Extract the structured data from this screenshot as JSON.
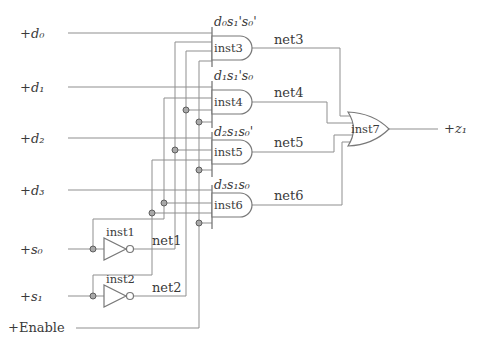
{
  "colors": {
    "background": "#ffffff",
    "wire": "#8f8f8f",
    "gate_outline": "#787878",
    "text": "#3a3a3a",
    "junction_dot": "#a8a8a8"
  },
  "inputs": [
    {
      "id": "d0",
      "label": "+d₀"
    },
    {
      "id": "d1",
      "label": "+d₁"
    },
    {
      "id": "d2",
      "label": "+d₂"
    },
    {
      "id": "d3",
      "label": "+d₃"
    },
    {
      "id": "s0",
      "label": "+s₀"
    },
    {
      "id": "s1",
      "label": "+s₁"
    },
    {
      "id": "enable",
      "label": "+Enable"
    }
  ],
  "output": {
    "label": "+z₁"
  },
  "inverters": [
    {
      "name": "inst1",
      "input": "+s₀",
      "net": "net1"
    },
    {
      "name": "inst2",
      "input": "+s₁",
      "net": "net2"
    }
  ],
  "and_gates": [
    {
      "name": "inst3",
      "expr": "d₀s₁'s₀'",
      "net": "net3"
    },
    {
      "name": "inst4",
      "expr": "d₁s₁'s₀",
      "net": "net4"
    },
    {
      "name": "inst5",
      "expr": "d₂s₁s₀'",
      "net": "net5"
    },
    {
      "name": "inst6",
      "expr": "d₃s₁s₀",
      "net": "net6"
    }
  ],
  "or_gate": {
    "name": "inst7",
    "inputs": [
      "net3",
      "net4",
      "net5",
      "net6"
    ],
    "output": "+z₁"
  }
}
